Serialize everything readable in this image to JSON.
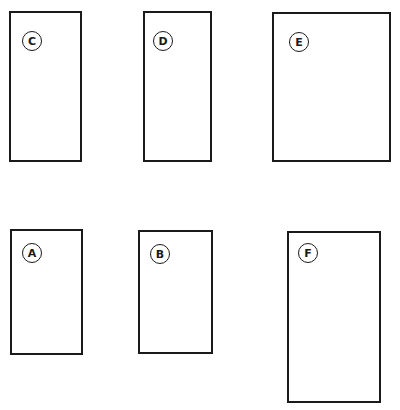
{
  "diagram": {
    "shapes": [
      {
        "id": "C",
        "label": "C",
        "x": 9,
        "y": 11,
        "w": 73,
        "h": 151,
        "cx": 22,
        "cy": 31
      },
      {
        "id": "D",
        "label": "D",
        "x": 143,
        "y": 11,
        "w": 69,
        "h": 151,
        "cx": 153,
        "cy": 31
      },
      {
        "id": "E",
        "label": "E",
        "x": 272,
        "y": 12,
        "w": 119,
        "h": 150,
        "cx": 289,
        "cy": 32
      },
      {
        "id": "A",
        "label": "A",
        "x": 10,
        "y": 229,
        "w": 73,
        "h": 126,
        "cx": 22,
        "cy": 243
      },
      {
        "id": "B",
        "label": "B",
        "x": 138,
        "y": 230,
        "w": 75,
        "h": 124,
        "cx": 150,
        "cy": 244
      },
      {
        "id": "F",
        "label": "F",
        "x": 287,
        "y": 231,
        "w": 94,
        "h": 172,
        "cx": 298,
        "cy": 243
      }
    ],
    "stroke_color": "#1a1a1a",
    "background": "#ffffff"
  }
}
